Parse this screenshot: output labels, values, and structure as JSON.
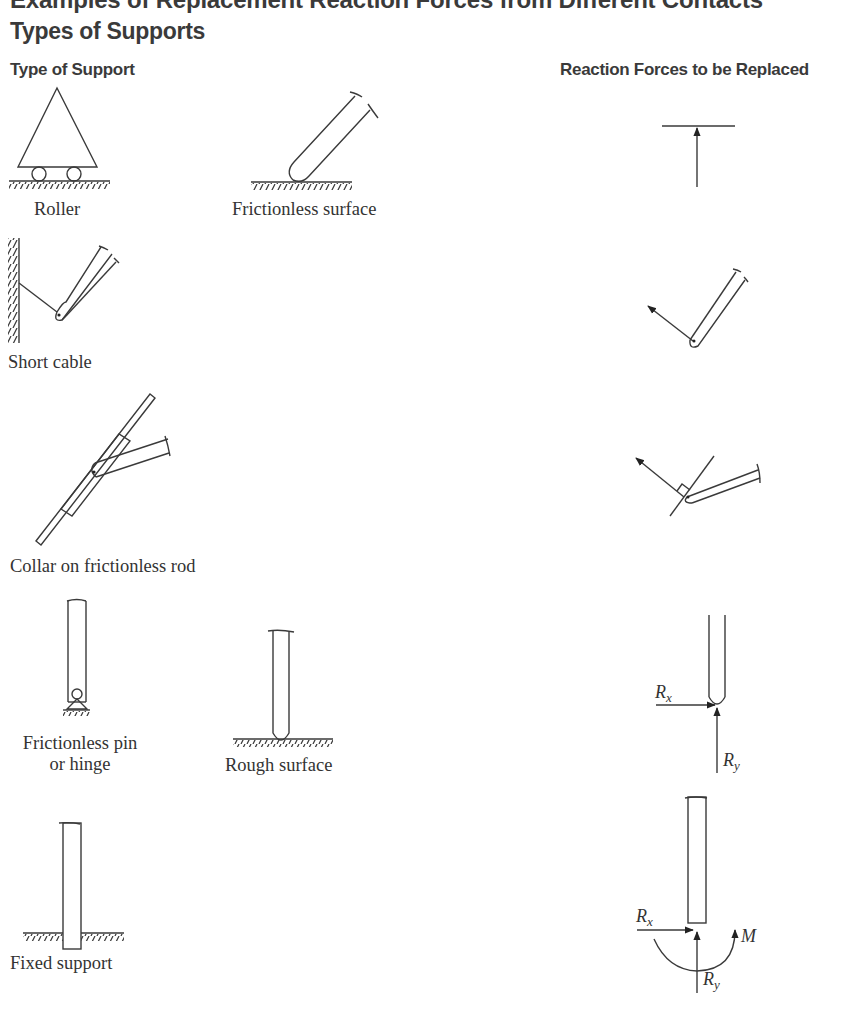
{
  "header": {
    "cut_title": "Examples of Replacement Reaction Forces from Different Contacts",
    "section_title": "Types of Supports"
  },
  "columns": {
    "left": "Type of Support",
    "right": "Reaction Forces to be Replaced"
  },
  "supports": [
    {
      "id": "roller",
      "label": "Roller",
      "reaction": "single normal force (upward)"
    },
    {
      "id": "frictionless-surface",
      "label": "Frictionless surface",
      "reaction": "single normal force (upward)"
    },
    {
      "id": "short-cable",
      "label": "Short cable",
      "reaction": "tension force along cable"
    },
    {
      "id": "collar",
      "label": "Collar on frictionless rod",
      "reaction": "force perpendicular to rod"
    },
    {
      "id": "pin",
      "label_line1": "Frictionless pin",
      "label_line2": "or hinge",
      "reaction": "Rx, Ry"
    },
    {
      "id": "rough-surface",
      "label": "Rough surface",
      "reaction": "Rx, Ry"
    },
    {
      "id": "fixed",
      "label": "Fixed support",
      "reaction": "Rx, Ry, M"
    }
  ],
  "symbols": {
    "rx_main": "R",
    "rx_sub": "x",
    "ry_main": "R",
    "ry_sub": "y",
    "moment": "M"
  }
}
